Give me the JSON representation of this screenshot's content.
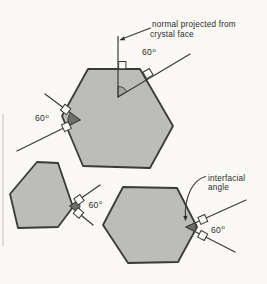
{
  "diagram": {
    "annotations": {
      "normal_label": {
        "line1": "normal projected from",
        "line2": "crystal face"
      },
      "interfacial_label": {
        "line1": "interfacial",
        "line2": "angle"
      }
    },
    "angle_markers": [
      {
        "site": "top-face-normal",
        "value": "60",
        "unit": "o"
      },
      {
        "site": "upper-left-faces",
        "value": "60",
        "unit": "o"
      },
      {
        "site": "small-crystal-faces",
        "value": "60",
        "unit": "o"
      },
      {
        "site": "interfacial-angle-site",
        "value": "60",
        "unit": "o"
      }
    ],
    "colors": {
      "background": "#faf9f5",
      "crystal_fill": "#bcbcb8",
      "outline": "#3a3a36",
      "wedge_fill": "#6e6e6a",
      "text": "#2b2b28"
    }
  }
}
